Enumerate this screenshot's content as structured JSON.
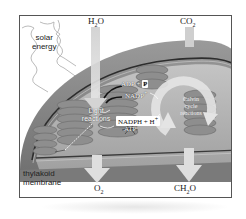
{
  "diagram": {
    "type": "chloroplast photosynthesis overview",
    "inputs": {
      "water": {
        "formula": "H",
        "sub": "2",
        "rest": "O"
      },
      "carbon_dioxide": {
        "formula": "CO",
        "sub": "2"
      },
      "light": {
        "line1": "solar",
        "line2": "energy"
      }
    },
    "outputs": {
      "oxygen": {
        "formula": "O",
        "sub": "2"
      },
      "sugar": {
        "formula": "CH",
        "sub": "2",
        "rest": "O"
      }
    },
    "structures": {
      "thylakoid": {
        "line1": "thylakoid",
        "line2": "membrane"
      },
      "light_reactions": {
        "line1": "Light",
        "line2": "reactions"
      },
      "calvin_cycle": {
        "line1": "Calvin",
        "line2": "cycle",
        "line3": "reactions"
      }
    },
    "carriers": {
      "adp_p": {
        "text": "ADP + ",
        "p": "P"
      },
      "nadp": {
        "text": "NADP",
        "sup": "+"
      },
      "nadph": {
        "text": "NADPH + H",
        "sup": "+"
      },
      "atp": {
        "text": "ATP"
      }
    },
    "colors": {
      "frame": "#555555",
      "outer_membrane": "#8a8a8a",
      "stroma": "#b8b8b8",
      "grana": "#9c9c9c",
      "arrows": "#d8d8d8"
    }
  }
}
